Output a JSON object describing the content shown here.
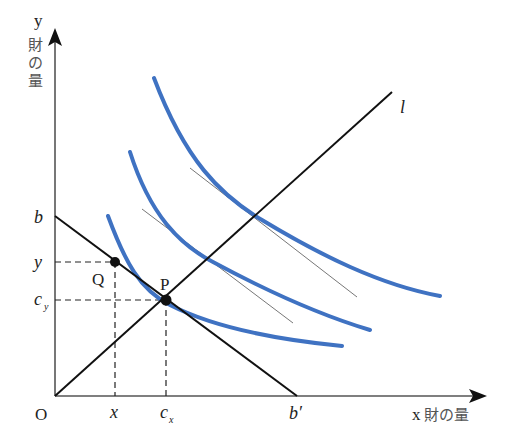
{
  "diagram": {
    "title": "",
    "axes": {
      "y_label_var": "y",
      "y_label_text": "財の量",
      "x_label_var": "x",
      "x_label_text": "財の量",
      "origin_label": "O"
    },
    "budget_line": {
      "y_intercept_label": "b",
      "x_intercept_label": "b′"
    },
    "ray": {
      "label": "l"
    },
    "points": {
      "Q": {
        "label": "Q",
        "x_label": "x",
        "y_label": "y"
      },
      "P": {
        "label": "P",
        "x_label": "c",
        "x_sub": "x",
        "y_label": "c",
        "y_sub": "y"
      }
    },
    "indifference_curves": [
      {
        "name": "curve-1",
        "note": "tangent to budget line at P"
      },
      {
        "name": "curve-2",
        "note": "tangent line where it crosses l"
      },
      {
        "name": "curve-3",
        "note": "tangent line where it crosses l"
      }
    ],
    "colors": {
      "curve": "#3f72c2",
      "axis": "#555555",
      "line": "#111111",
      "tangent": "#777777"
    }
  }
}
